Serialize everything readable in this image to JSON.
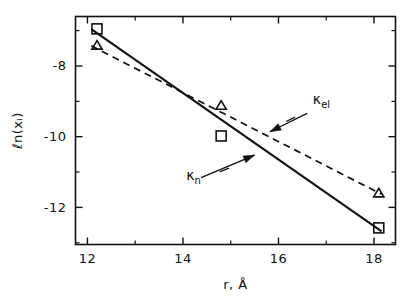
{
  "figure": {
    "background_color": "#ffffff",
    "ink_color": "#111111"
  },
  "chart_data": {
    "type": "scatter",
    "title": "",
    "subtitle": "",
    "xlabel": "r, Å",
    "ylabel": "ℓn(xᵢ)",
    "xlim": [
      11.75,
      18.45
    ],
    "ylim": [
      -13.05,
      -6.6
    ],
    "grid": false,
    "legend_position": "inline-annotations",
    "xticks": [
      12,
      14,
      16,
      18
    ],
    "xticklabels": [
      "12",
      "14",
      "16",
      "18"
    ],
    "xticks_minor": [
      13,
      15,
      17
    ],
    "yticks": [
      -8,
      -10,
      -12
    ],
    "yticklabels": [
      "-8",
      "-10",
      "-12"
    ],
    "yticks_minor": [
      -7,
      -9,
      -11,
      -13
    ],
    "series": [
      {
        "name": "κₙ",
        "label_base": "κ",
        "label_sub": "n",
        "marker": "square-open",
        "line_style": "solid",
        "points": [
          {
            "x": 12.2,
            "y": -6.95
          },
          {
            "x": 14.8,
            "y": -9.98
          },
          {
            "x": 18.1,
            "y": -12.58
          }
        ],
        "fit_line": {
          "x_start": 12.08,
          "y_start": -6.96,
          "x_end": 18.16,
          "y_end": -12.68,
          "slope": -0.94,
          "intercept": 4.4
        }
      },
      {
        "name": "κₑₗ",
        "label_base": "κ",
        "label_sub": "el",
        "marker": "triangle-open",
        "line_style": "dashed",
        "points": [
          {
            "x": 12.2,
            "y": -7.42
          },
          {
            "x": 14.8,
            "y": -9.12
          },
          {
            "x": 18.1,
            "y": -11.6
          }
        ],
        "fit_line": {
          "x_start": 12.08,
          "y_start": -7.43,
          "x_end": 18.16,
          "y_end": -11.63,
          "slope": -0.69,
          "intercept": 0.91
        }
      }
    ],
    "annotations": [
      {
        "text": "κₑₗ",
        "base": "κ",
        "sub": "el",
        "label_x": 16.72,
        "label_y": -9.08,
        "arrow_from_x": 16.6,
        "arrow_from_y": -9.34,
        "arrow_to_x": 15.82,
        "arrow_to_y": -9.86,
        "target_series": "κₑₗ"
      },
      {
        "text": "κₙ",
        "base": "κ",
        "sub": "n",
        "label_x": 14.07,
        "label_y": -11.22,
        "arrow_from_x": 14.38,
        "arrow_from_y": -11.16,
        "arrow_to_x": 15.5,
        "arrow_to_y": -10.52,
        "target_series": "κₙ"
      }
    ]
  }
}
